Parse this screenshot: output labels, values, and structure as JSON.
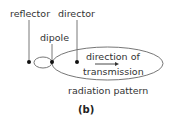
{
  "diagram": {
    "labels": {
      "reflector": "reflector",
      "director": "director",
      "dipole": "dipole",
      "direction_line1": "direction of",
      "direction_line2": "transmission",
      "pattern": "radiation pattern",
      "caption": "(b)"
    },
    "colors": {
      "line": "#555555",
      "dot": "#111111",
      "text": "#333333"
    },
    "elements": [
      "reflector-dot",
      "dipole-dot",
      "director-dot",
      "reflector-loop",
      "radiation-pattern-ellipse",
      "direction-arrow"
    ]
  }
}
